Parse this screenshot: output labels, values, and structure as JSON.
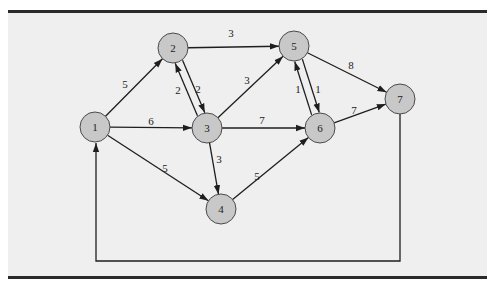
{
  "diagram": {
    "type": "directed-weighted-network",
    "colors": {
      "background": "#efefef",
      "node_fill": "#c8c8c8",
      "node_stroke": "#4a4a4a",
      "edge": "#1e1e1e",
      "rule": "#2a2a2a"
    },
    "nodes": [
      {
        "id": "1",
        "label": "1",
        "x": 95,
        "y": 127
      },
      {
        "id": "2",
        "label": "2",
        "x": 173,
        "y": 48
      },
      {
        "id": "3",
        "label": "3",
        "x": 207,
        "y": 128
      },
      {
        "id": "4",
        "label": "4",
        "x": 221,
        "y": 209
      },
      {
        "id": "5",
        "label": "5",
        "x": 294,
        "y": 46
      },
      {
        "id": "6",
        "label": "6",
        "x": 320,
        "y": 128
      },
      {
        "id": "7",
        "label": "7",
        "x": 400,
        "y": 99
      }
    ],
    "edges": [
      {
        "from": "1",
        "to": "2",
        "weight": "5",
        "lx": 125,
        "ly": 84
      },
      {
        "from": "1",
        "to": "3",
        "weight": "6",
        "lx": 151,
        "ly": 121
      },
      {
        "from": "1",
        "to": "4",
        "weight": "5",
        "lx": 165,
        "ly": 168
      },
      {
        "from": "2",
        "to": "5",
        "weight": "3",
        "lx": 231,
        "ly": 33
      },
      {
        "from": "2",
        "to": "3",
        "weight": "2",
        "lx": 178,
        "ly": 90,
        "offset": -4
      },
      {
        "from": "3",
        "to": "2",
        "weight": "2",
        "lx": 198,
        "ly": 89,
        "offset": -4
      },
      {
        "from": "3",
        "to": "5",
        "weight": "3",
        "lx": 247,
        "ly": 80
      },
      {
        "from": "3",
        "to": "6",
        "weight": "7",
        "lx": 262,
        "ly": 120
      },
      {
        "from": "3",
        "to": "4",
        "weight": "3",
        "lx": 219,
        "ly": 159
      },
      {
        "from": "4",
        "to": "6",
        "weight": "5",
        "lx": 257,
        "ly": 176
      },
      {
        "from": "5",
        "to": "6",
        "weight": "1",
        "lx": 298,
        "ly": 89,
        "offset": -4
      },
      {
        "from": "6",
        "to": "5",
        "weight": "1",
        "lx": 318,
        "ly": 89,
        "offset": -4
      },
      {
        "from": "5",
        "to": "7",
        "weight": "8",
        "lx": 351,
        "ly": 65
      },
      {
        "from": "6",
        "to": "7",
        "weight": "7",
        "lx": 354,
        "ly": 110
      },
      {
        "from": "7",
        "to": "1",
        "weight": "",
        "route": "loop-bottom",
        "bottom_y": 261
      }
    ]
  }
}
